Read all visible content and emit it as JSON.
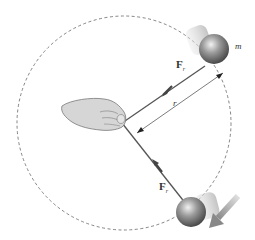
{
  "diagram": {
    "labels": {
      "mass": "m",
      "radius": "r",
      "force_top_main": "F",
      "force_top_sub": "r",
      "force_bottom_main": "F",
      "force_bottom_sub": "r"
    },
    "elements": {
      "circle_path": "dashed circular path",
      "hand": "hand holding string at center",
      "ball_top": "mass at upper right",
      "ball_bottom": "mass at bottom",
      "motion_arrow": "direction of motion arrow"
    },
    "colors": {
      "ball": "#8a8a8a",
      "string": "#555555",
      "dashed_circle": "#666666",
      "motion_arrow": "#9a9a9a",
      "hand": "#d4d4d4"
    }
  }
}
